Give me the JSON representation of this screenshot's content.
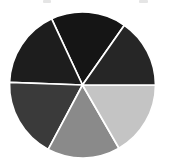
{
  "figure": {
    "width": 169,
    "height": 166,
    "background": "#ffffff",
    "title": "",
    "alt_text": "Six-segment grayscale pie chart"
  },
  "geometry": {
    "center_x": 82.5,
    "center_y": 85,
    "radius": 73,
    "separator_color": "#ffffff",
    "separator_width": 1.7
  },
  "artifacts": [
    {
      "name": "crop-artifact-left",
      "x": 43,
      "y": 0,
      "w": 8,
      "h": 3
    },
    {
      "name": "crop-artifact-right",
      "x": 139,
      "y": 0,
      "w": 9,
      "h": 3
    }
  ],
  "chart_data": {
    "type": "pie",
    "title": "",
    "subtitle": "",
    "xlabel": "",
    "ylabel": "",
    "legend_position": "none",
    "grid": false,
    "start_angle_deg": 55,
    "direction": "counterclockwise",
    "total": 100,
    "categories": [
      "Segment 1",
      "Segment 2",
      "Segment 3",
      "Segment 4",
      "Segment 5",
      "Segment 6"
    ],
    "values": [
      16.67,
      16.67,
      16.67,
      16.67,
      16.67,
      16.67
    ],
    "slices": [
      {
        "label": "Segment 1",
        "value": 16.67,
        "percent": "16.7%",
        "color": "#151515",
        "start_deg": 55,
        "end_deg": 115,
        "position": "top-left"
      },
      {
        "label": "Segment 2",
        "value": 16.67,
        "percent": "16.7%",
        "color": "#1d1d1d",
        "start_deg": 115,
        "end_deg": 178,
        "position": "left-upper"
      },
      {
        "label": "Segment 3",
        "value": 16.67,
        "percent": "16.7%",
        "color": "#3a3a3a",
        "start_deg": 178,
        "end_deg": 242,
        "position": "left-lower"
      },
      {
        "label": "Segment 4",
        "value": 16.67,
        "percent": "16.7%",
        "color": "#8a8a8a",
        "start_deg": 242,
        "end_deg": 300,
        "position": "bottom"
      },
      {
        "label": "Segment 5",
        "value": 16.67,
        "percent": "16.7%",
        "color": "#c4c4c4",
        "start_deg": 300,
        "end_deg": 360,
        "position": "bottom-right"
      },
      {
        "label": "Segment 6",
        "value": 16.67,
        "percent": "16.7%",
        "color": "#262626",
        "start_deg": 0,
        "end_deg": 55,
        "position": "right-upper"
      }
    ]
  }
}
